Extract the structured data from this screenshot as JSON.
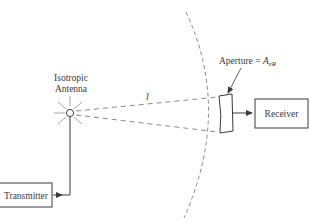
{
  "diagram": {
    "antenna": {
      "label_line1": "Isotropic",
      "label_line2": "Antenna"
    },
    "distance_label": "l",
    "aperture": {
      "label_prefix": "Aperture = ",
      "label_symbol": "A",
      "label_subscript": "eR"
    },
    "receiver": {
      "label": "Receiver"
    },
    "transmitter": {
      "label": "Transmitter"
    },
    "colors": {
      "stroke": "#3a3a3a",
      "dashed": "#6a6a6a",
      "rays": "#9a9a9a",
      "background": "#ffffff"
    }
  }
}
